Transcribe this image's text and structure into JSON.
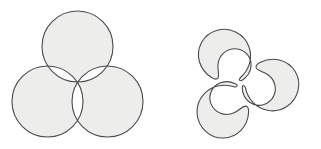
{
  "image": {
    "width": 321,
    "height": 149,
    "background_color": "#ffffff",
    "title": "Three overlapping circles and three interlocking lobes"
  },
  "style": {
    "fill_color": "#ededeb",
    "stroke_color": "#4a4a4a",
    "stroke_width": 1.1,
    "white_color": "#ffffff"
  },
  "figures": [
    {
      "id": "venn-three-circles",
      "name": "three-overlapping-circles",
      "description": "Three equal circles in triangular arrangement; pairwise lens overlaps and the central triangle region are unfilled (white)",
      "fill_rule": "evenodd",
      "circle_radius": 35.5,
      "circles": [
        {
          "name": "top-circle",
          "cx": 77.5,
          "cy": 46.5,
          "r": 35.5
        },
        {
          "name": "bottom-left-circle",
          "cx": 47.5,
          "cy": 101.5,
          "r": 35.5
        },
        {
          "name": "bottom-right-circle",
          "cx": 107.5,
          "cy": 101.5,
          "r": 35.5
        }
      ]
    },
    {
      "id": "triskelion-three-lobes",
      "name": "three-interlocking-lobes",
      "description": "Three comma-shaped lobes rotated 120 degrees apart, interlocking around a common center, forming a triskelion",
      "center": {
        "x": 240.0,
        "y": 84.0
      },
      "rotations_deg": [
        0,
        120,
        240
      ],
      "lobes": [
        {
          "name": "top-lobe",
          "rotation_deg": 0
        },
        {
          "name": "bottom-left-lobe",
          "rotation_deg": 120
        },
        {
          "name": "bottom-right-lobe",
          "rotation_deg": 240
        }
      ]
    }
  ]
}
